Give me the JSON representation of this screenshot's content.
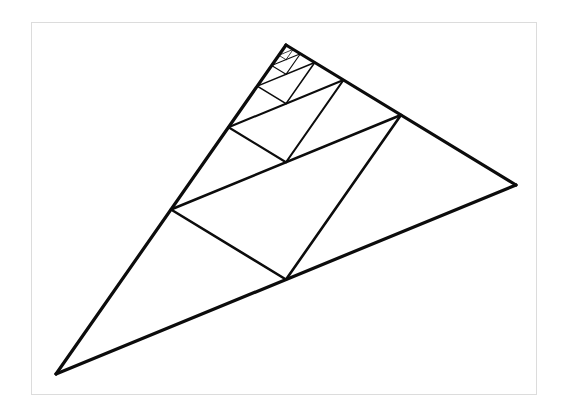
{
  "figure": {
    "background_color": "#ffffff",
    "stroke_color": "#0c0c0c",
    "frame_color": "#dcdcdc",
    "canvas": {
      "width": 564,
      "height": 420
    },
    "frame": {
      "x": 31,
      "y": 22,
      "width": 506,
      "height": 373
    },
    "outer_triangle": {
      "label": "outer-triangle",
      "vertices": [
        {
          "name": "apex",
          "x": 286,
          "y": 45
        },
        {
          "name": "bottom-left",
          "x": 56,
          "y": 374
        },
        {
          "name": "right",
          "x": 516,
          "y": 185
        }
      ],
      "stroke_width": 3.2
    },
    "recursion": {
      "levels": 5,
      "rule": "connect the midpoints of the current triangle, then recurse into the sub-triangle containing the apex",
      "stroke_widths": [
        3.2,
        2.6,
        2.1,
        1.6,
        1.1,
        0.8
      ],
      "level_triangles": [
        {
          "level": 0,
          "vertices": [
            {
              "x": 286,
              "y": 45
            },
            {
              "x": 56,
              "y": 374
            },
            {
              "x": 516,
              "y": 185
            }
          ]
        },
        {
          "level": 1,
          "vertices": [
            {
              "x": 171,
              "y": 209.5
            },
            {
              "x": 286,
              "y": 279.5
            },
            {
              "x": 401,
              "y": 115
            }
          ]
        },
        {
          "level": 2,
          "vertices": [
            {
              "x": 228.5,
              "y": 127.25
            },
            {
              "x": 286,
              "y": 162.25
            },
            {
              "x": 343.5,
              "y": 80
            }
          ]
        },
        {
          "level": 3,
          "vertices": [
            {
              "x": 257.25,
              "y": 86.125
            },
            {
              "x": 286,
              "y": 103.625
            },
            {
              "x": 314.75,
              "y": 62.5
            }
          ]
        },
        {
          "level": 4,
          "vertices": [
            {
              "x": 271.625,
              "y": 65.5625
            },
            {
              "x": 286,
              "y": 74.3125
            },
            {
              "x": 300.375,
              "y": 53.75
            }
          ]
        }
      ]
    }
  }
}
